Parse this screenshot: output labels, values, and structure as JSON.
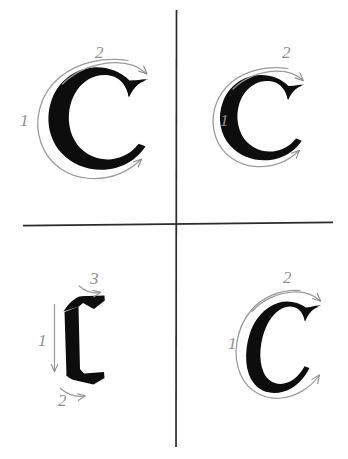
{
  "figure": {
    "background_color": "#ffffff",
    "divider_color": "#2b2b2b",
    "glyph_color": "#0d0d0d",
    "annotation_color": "#8c8c8c",
    "width": 348,
    "height": 459
  },
  "panels": [
    {
      "id": "top-left",
      "glyph": "C",
      "style_note": "heavy round serif C",
      "stroke_count": 2,
      "strokes": [
        {
          "number": "1",
          "direction": "counter-clockwise arc",
          "label_x": 20,
          "label_y": 121
        },
        {
          "number": "2",
          "direction": "clockwise arc to upper right",
          "label_x": 98,
          "label_y": 55
        }
      ]
    },
    {
      "id": "top-right",
      "glyph": "C",
      "style_note": "heavy round serif C",
      "stroke_count": 2,
      "strokes": [
        {
          "number": "1",
          "direction": "counter-clockwise arc",
          "label_x": 222,
          "label_y": 121
        },
        {
          "number": "2",
          "direction": "clockwise arc to upper right",
          "label_x": 285,
          "label_y": 55
        }
      ]
    },
    {
      "id": "bottom-left",
      "glyph": "C",
      "style_note": "blackletter fraktur C",
      "stroke_count": 3,
      "strokes": [
        {
          "number": "1",
          "direction": "straight downward stem",
          "label_x": 41,
          "label_y": 341
        },
        {
          "number": "2",
          "direction": "rightward foot stroke",
          "label_x": 62,
          "label_y": 401
        },
        {
          "number": "3",
          "direction": "rightward top flag stroke",
          "label_x": 94,
          "label_y": 281
        }
      ]
    },
    {
      "id": "bottom-right",
      "glyph": "C",
      "style_note": "narrow italic calligraphic C",
      "stroke_count": 2,
      "strokes": [
        {
          "number": "1",
          "direction": "counter-clockwise arc",
          "label_x": 230,
          "label_y": 344
        },
        {
          "number": "2",
          "direction": "clockwise arc to upper right",
          "label_x": 286,
          "label_y": 280
        }
      ]
    }
  ],
  "dividers": {
    "vertical": {
      "x": 176,
      "y1": 10,
      "y2": 447
    },
    "horizontal": {
      "y": 224,
      "x1": 23,
      "x2": 333
    }
  }
}
